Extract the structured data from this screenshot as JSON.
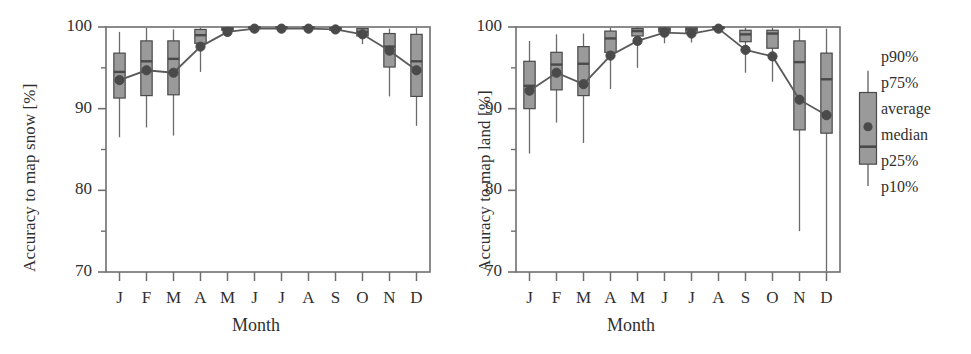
{
  "figure": {
    "panels": [
      {
        "id": "snow",
        "ylabel": "Accuracy to map snow [%]",
        "xlabel": "Month"
      },
      {
        "id": "land",
        "ylabel": "Accuracy to map land [%]",
        "xlabel": "Month"
      }
    ],
    "legend": {
      "items": [
        {
          "key": "p90",
          "label": "p90%"
        },
        {
          "key": "p75",
          "label": "p75%"
        },
        {
          "key": "average",
          "label": "average"
        },
        {
          "key": "median",
          "label": "median"
        },
        {
          "key": "p25",
          "label": "p25%"
        },
        {
          "key": "p10",
          "label": "p10%"
        }
      ],
      "sample": {
        "p10": 78.5,
        "p25": 82.0,
        "median": 84.8,
        "average": 88.0,
        "p75": 93.5,
        "p90": 97.0
      }
    },
    "colors": {
      "box_fill": "#9a9a9a",
      "box_edge": "#4a4a4a",
      "whisker": "#6a6a6a",
      "median_line": "#4a4a4a",
      "average_marker": "#4a4a4a",
      "average_line": "#5a5a5a",
      "axis": "#6f6f6f",
      "text": "#2f2f2f",
      "background": "#ffffff"
    }
  },
  "chart_data": [
    {
      "type": "box",
      "id": "snow",
      "title": "",
      "xlabel": "Month",
      "ylabel": "Accuracy to map snow [%]",
      "categories": [
        "J",
        "F",
        "M",
        "A",
        "M",
        "J",
        "J",
        "A",
        "S",
        "O",
        "N",
        "D"
      ],
      "ylim": [
        70,
        100
      ],
      "ymajor_ticks": [
        70,
        80,
        90,
        100
      ],
      "yminor_ticks": [
        75,
        85,
        95
      ],
      "grid": false,
      "legend_position": "right-outside",
      "series": [
        {
          "name": "average",
          "values": [
            93.5,
            94.7,
            94.4,
            97.6,
            99.4,
            99.8,
            99.8,
            99.8,
            99.7,
            99.1,
            97.1,
            94.7
          ]
        }
      ],
      "boxes": [
        {
          "month": "J",
          "p10": 86.5,
          "p25": 91.3,
          "median": 94.5,
          "p75": 96.8,
          "p90": 99.4
        },
        {
          "month": "F",
          "p10": 87.7,
          "p25": 91.6,
          "median": 95.8,
          "p75": 98.3,
          "p90": 99.9
        },
        {
          "month": "M",
          "p10": 86.7,
          "p25": 91.7,
          "median": 96.1,
          "p75": 98.3,
          "p90": 99.7
        },
        {
          "month": "A",
          "p10": 94.5,
          "p25": 98.0,
          "median": 99.0,
          "p75": 99.7,
          "p90": 99.9
        },
        {
          "month": "M",
          "p10": 99.1,
          "p25": 99.6,
          "median": 99.8,
          "p75": 99.9,
          "p90": 100.0
        },
        {
          "month": "J",
          "p10": 99.6,
          "p25": 99.8,
          "median": 99.9,
          "p75": 100.0,
          "p90": 100.0
        },
        {
          "month": "J",
          "p10": 99.6,
          "p25": 99.8,
          "median": 99.9,
          "p75": 100.0,
          "p90": 100.0
        },
        {
          "month": "A",
          "p10": 99.6,
          "p25": 99.8,
          "median": 99.9,
          "p75": 100.0,
          "p90": 100.0
        },
        {
          "month": "S",
          "p10": 99.3,
          "p25": 99.6,
          "median": 99.8,
          "p75": 99.9,
          "p90": 100.0
        },
        {
          "month": "O",
          "p10": 97.9,
          "p25": 98.9,
          "median": 99.4,
          "p75": 99.8,
          "p90": 99.9
        },
        {
          "month": "N",
          "p10": 91.5,
          "p25": 95.1,
          "median": 97.6,
          "p75": 99.2,
          "p90": 99.8
        },
        {
          "month": "D",
          "p10": 87.9,
          "p25": 91.5,
          "median": 95.8,
          "p75": 99.1,
          "p90": 99.9
        }
      ]
    },
    {
      "type": "box",
      "id": "land",
      "title": "",
      "xlabel": "Month",
      "ylabel": "Accuracy to map land [%]",
      "categories": [
        "J",
        "F",
        "M",
        "A",
        "M",
        "J",
        "J",
        "A",
        "S",
        "O",
        "N",
        "D"
      ],
      "ylim": [
        70,
        100
      ],
      "ymajor_ticks": [
        70,
        80,
        90,
        100
      ],
      "yminor_ticks": [
        75,
        85,
        95
      ],
      "grid": false,
      "legend_position": "right-outside",
      "series": [
        {
          "name": "average",
          "values": [
            92.2,
            94.4,
            93.0,
            96.5,
            98.3,
            99.3,
            99.2,
            99.8,
            97.2,
            96.4,
            91.1,
            89.2
          ]
        }
      ],
      "boxes": [
        {
          "month": "J",
          "p10": 84.5,
          "p25": 90.0,
          "median": 92.8,
          "p75": 95.8,
          "p90": 98.3
        },
        {
          "month": "F",
          "p10": 88.3,
          "p25": 92.3,
          "median": 95.4,
          "p75": 96.9,
          "p90": 99.1
        },
        {
          "month": "M",
          "p10": 85.8,
          "p25": 91.6,
          "median": 95.5,
          "p75": 97.6,
          "p90": 99.2
        },
        {
          "month": "A",
          "p10": 92.4,
          "p25": 96.9,
          "median": 98.6,
          "p75": 99.5,
          "p90": 99.9
        },
        {
          "month": "M",
          "p10": 95.0,
          "p25": 98.9,
          "median": 99.5,
          "p75": 99.8,
          "p90": 100.0
        },
        {
          "month": "J",
          "p10": 98.0,
          "p25": 99.4,
          "median": 99.7,
          "p75": 99.9,
          "p90": 100.0
        },
        {
          "month": "J",
          "p10": 98.1,
          "p25": 99.3,
          "median": 99.7,
          "p75": 99.9,
          "p90": 100.0
        },
        {
          "month": "A",
          "p10": 99.4,
          "p25": 99.8,
          "median": 99.9,
          "p75": 100.0,
          "p90": 100.0
        },
        {
          "month": "S",
          "p10": 94.4,
          "p25": 98.2,
          "median": 99.1,
          "p75": 99.6,
          "p90": 99.9
        },
        {
          "month": "O",
          "p10": 93.3,
          "p25": 97.4,
          "median": 99.2,
          "p75": 99.6,
          "p90": 99.9
        },
        {
          "month": "N",
          "p10": 75.0,
          "p25": 87.4,
          "median": 95.7,
          "p75": 98.3,
          "p90": 99.8
        },
        {
          "month": "D",
          "p10": 70.1,
          "p25": 87.0,
          "median": 93.6,
          "p75": 96.8,
          "p90": 99.8
        }
      ]
    }
  ]
}
